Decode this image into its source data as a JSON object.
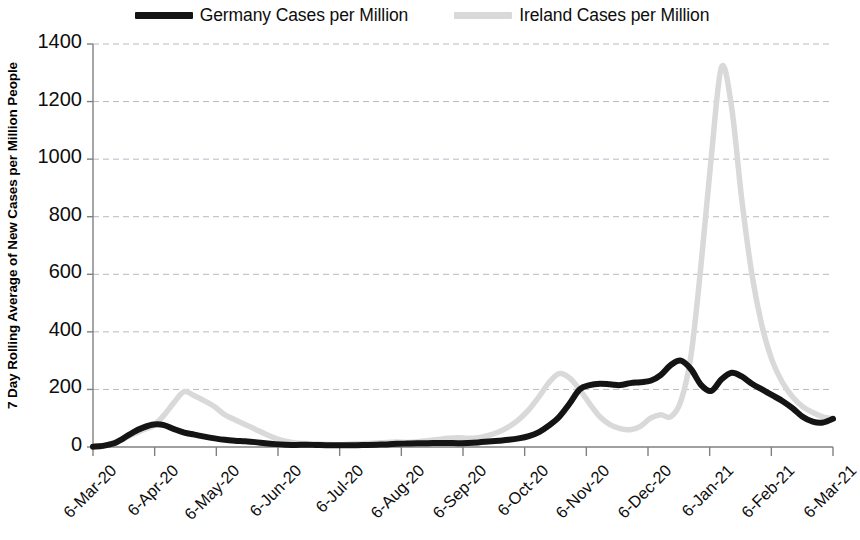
{
  "legend": {
    "position": "top-center",
    "entries": [
      {
        "label": "Germany Cases per Million",
        "color": "#141414",
        "swatch": "legend-swatch-germany"
      },
      {
        "label": "Ireland Cases per Million",
        "color": "#d9d9d9",
        "swatch": "legend-swatch-ireland"
      }
    ]
  },
  "axes": {
    "ylabel": "7 Day Rolling Average of New Cases per Million People",
    "xlabel": "",
    "yticks": [
      "1400",
      "1200",
      "1000",
      "800",
      "600",
      "400",
      "200",
      "0"
    ],
    "xticks": [
      "6-Mar-20",
      "6-Apr-20",
      "6-May-20",
      "6-Jun-20",
      "6-Jul-20",
      "6-Aug-20",
      "6-Sep-20",
      "6-Oct-20",
      "6-Nov-20",
      "6-Dec-20",
      "6-Jan-21",
      "6-Feb-21",
      "6-Mar-21"
    ]
  },
  "chart_data": {
    "type": "line",
    "title": "",
    "xlabel": "",
    "ylabel": "7 Day Rolling Average of New Cases per Million People",
    "ylim": [
      0,
      1400
    ],
    "xlim": [
      "6-Mar-20",
      "6-Mar-21"
    ],
    "ytick_values": [
      0,
      200,
      400,
      600,
      800,
      1000,
      1200,
      1400
    ],
    "xtick_labels": [
      "6-Mar-20",
      "6-Apr-20",
      "6-May-20",
      "6-Jun-20",
      "6-Jul-20",
      "6-Aug-20",
      "6-Sep-20",
      "6-Oct-20",
      "6-Nov-20",
      "6-Dec-20",
      "6-Jan-21",
      "6-Feb-21",
      "6-Mar-21"
    ],
    "grid": "horizontal-dashed",
    "legend_position": "top-center",
    "x": [
      "6-Mar-20",
      "11-Mar-20",
      "16-Mar-20",
      "21-Mar-20",
      "26-Mar-20",
      "31-Mar-20",
      "5-Apr-20",
      "10-Apr-20",
      "15-Apr-20",
      "20-Apr-20",
      "25-Apr-20",
      "30-Apr-20",
      "5-May-20",
      "10-May-20",
      "15-May-20",
      "20-May-20",
      "25-May-20",
      "30-May-20",
      "4-Jun-20",
      "9-Jun-20",
      "14-Jun-20",
      "19-Jun-20",
      "24-Jun-20",
      "29-Jun-20",
      "4-Jul-20",
      "9-Jul-20",
      "14-Jul-20",
      "19-Jul-20",
      "24-Jul-20",
      "29-Jul-20",
      "3-Aug-20",
      "8-Aug-20",
      "13-Aug-20",
      "18-Aug-20",
      "23-Aug-20",
      "28-Aug-20",
      "2-Sep-20",
      "7-Sep-20",
      "12-Sep-20",
      "17-Sep-20",
      "22-Sep-20",
      "27-Sep-20",
      "2-Oct-20",
      "7-Oct-20",
      "12-Oct-20",
      "17-Oct-20",
      "22-Oct-20",
      "27-Oct-20",
      "1-Nov-20",
      "6-Nov-20",
      "11-Nov-20",
      "16-Nov-20",
      "21-Nov-20",
      "26-Nov-20",
      "1-Dec-20",
      "6-Dec-20",
      "11-Dec-20",
      "16-Dec-20",
      "21-Dec-20",
      "26-Dec-20",
      "31-Dec-20",
      "5-Jan-21",
      "10-Jan-21",
      "15-Jan-21",
      "20-Jan-21",
      "25-Jan-21",
      "30-Jan-21",
      "4-Feb-21",
      "9-Feb-21",
      "14-Feb-21",
      "19-Feb-21",
      "24-Feb-21",
      "1-Mar-21",
      "6-Mar-21"
    ],
    "series": [
      {
        "name": "Germany Cases per Million",
        "color": "#141414",
        "values": [
          1,
          4,
          12,
          30,
          52,
          68,
          78,
          76,
          62,
          50,
          43,
          36,
          30,
          25,
          22,
          20,
          17,
          13,
          10,
          8,
          7,
          8,
          7,
          6,
          6,
          6,
          6,
          7,
          8,
          9,
          11,
          12,
          13,
          13,
          14,
          14,
          13,
          14,
          16,
          19,
          22,
          25,
          30,
          38,
          52,
          75,
          105,
          150,
          200,
          215,
          220,
          218,
          215,
          222,
          225,
          230,
          250,
          285,
          300,
          270,
          215,
          195,
          235,
          258,
          245,
          220,
          200,
          180,
          160,
          135,
          105,
          88,
          85,
          98
        ]
      },
      {
        "name": "Ireland Cases per Million",
        "color": "#d9d9d9",
        "values": [
          1,
          5,
          14,
          28,
          45,
          60,
          75,
          110,
          155,
          192,
          178,
          160,
          140,
          112,
          95,
          78,
          62,
          45,
          30,
          20,
          14,
          12,
          10,
          9,
          8,
          9,
          11,
          12,
          14,
          16,
          17,
          16,
          18,
          22,
          26,
          30,
          32,
          30,
          32,
          40,
          52,
          70,
          95,
          130,
          175,
          225,
          255,
          240,
          200,
          150,
          105,
          78,
          64,
          60,
          72,
          100,
          112,
          105,
          160,
          320,
          640,
          1010,
          1320,
          1180,
          860,
          600,
          420,
          300,
          225,
          175,
          140,
          120,
          105,
          98
        ]
      }
    ]
  }
}
